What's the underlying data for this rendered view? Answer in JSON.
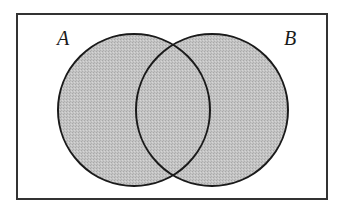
{
  "diagram": {
    "type": "venn",
    "universe": {
      "x": 17,
      "y": 14,
      "width": 310,
      "height": 185,
      "stroke": "#333333",
      "fill": "#ffffff"
    },
    "sets": [
      {
        "label": "A",
        "cx": 134,
        "cy": 110,
        "r": 76,
        "label_x": 57,
        "label_y": 45
      },
      {
        "label": "B",
        "cx": 212,
        "cy": 110,
        "r": 76,
        "label_x": 284,
        "label_y": 45
      }
    ],
    "shading": {
      "fill": "#bdbdbd",
      "description": "A ∪ B shaded"
    },
    "stroke_color": "#1a1a1a"
  }
}
